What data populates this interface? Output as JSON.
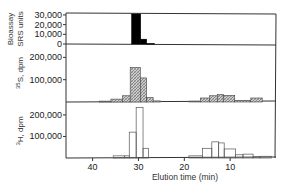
{
  "chart_data": [
    {
      "type": "bar",
      "panel": "top",
      "ylabel_lines": [
        "Bioassay",
        "SRS units"
      ],
      "ylim": [
        0,
        32000
      ],
      "yticks": [
        0,
        10000,
        20000,
        30000
      ],
      "ytick_labels": [
        "0",
        "10,000",
        "20,000",
        "30,000"
      ],
      "fill": "solid-black",
      "bars": [
        {
          "x0": 31.5,
          "x1": 29.5,
          "value": 31000
        },
        {
          "x0": 29.5,
          "x1": 28.2,
          "value": 5000
        },
        {
          "x0": 28.2,
          "x1": 26.5,
          "value": 500
        }
      ]
    },
    {
      "type": "bar",
      "panel": "middle",
      "ylabel_prefix": "35",
      "ylabel": "S, dpm",
      "ylim": [
        0,
        260000
      ],
      "yticks": [
        100000,
        200000
      ],
      "ytick_labels": [
        "100,000",
        "200,000"
      ],
      "fill": "hatched",
      "bars": [
        {
          "x0": 38.5,
          "x1": 36.0,
          "value": 4000
        },
        {
          "x0": 36.0,
          "x1": 33.5,
          "value": 13000
        },
        {
          "x0": 33.5,
          "x1": 31.8,
          "value": 28000
        },
        {
          "x0": 31.8,
          "x1": 29.6,
          "value": 155000
        },
        {
          "x0": 29.6,
          "x1": 28.2,
          "value": 108000
        },
        {
          "x0": 28.2,
          "x1": 26.8,
          "value": 20000
        },
        {
          "x0": 26.8,
          "x1": 25.2,
          "value": 5000
        },
        {
          "x0": 19.0,
          "x1": 16.5,
          "value": 4000
        },
        {
          "x0": 16.5,
          "x1": 14.5,
          "value": 18000
        },
        {
          "x0": 14.5,
          "x1": 12.8,
          "value": 28000
        },
        {
          "x0": 12.8,
          "x1": 11.5,
          "value": 33000
        },
        {
          "x0": 11.5,
          "x1": 9.0,
          "value": 30000
        },
        {
          "x0": 9.0,
          "x1": 5.5,
          "value": 6000
        },
        {
          "x0": 5.5,
          "x1": 3.0,
          "value": 18000
        }
      ]
    },
    {
      "type": "bar",
      "panel": "bottom",
      "ylabel_prefix": "3",
      "ylabel": "H, dpm",
      "ylim": [
        0,
        260000
      ],
      "yticks": [
        100000,
        200000
      ],
      "ytick_labels": [
        "100,000",
        "200,000"
      ],
      "fill": "open",
      "bars": [
        {
          "x0": 35.5,
          "x1": 33.0,
          "value": 10000
        },
        {
          "x0": 33.0,
          "x1": 32.0,
          "value": 10000
        },
        {
          "x0": 32.0,
          "x1": 30.5,
          "value": 120000
        },
        {
          "x0": 30.5,
          "x1": 29.0,
          "value": 235000
        },
        {
          "x0": 29.0,
          "x1": 27.8,
          "value": 45000
        },
        {
          "x0": 19.0,
          "x1": 16.0,
          "value": 10000
        },
        {
          "x0": 16.0,
          "x1": 14.0,
          "value": 45000
        },
        {
          "x0": 14.0,
          "x1": 12.5,
          "value": 75000
        },
        {
          "x0": 12.5,
          "x1": 11.3,
          "value": 70000
        },
        {
          "x0": 11.3,
          "x1": 8.8,
          "value": 42000
        },
        {
          "x0": 8.8,
          "x1": 7.2,
          "value": 15000
        },
        {
          "x0": 7.2,
          "x1": 5.0,
          "value": 18000
        },
        {
          "x0": 5.0,
          "x1": 3.5,
          "value": 6000
        },
        {
          "x0": 3.5,
          "x1": 1.0,
          "value": 8000
        }
      ]
    }
  ],
  "x_axis": {
    "label": "Elution time (min)",
    "xlim": [
      45.8,
      0
    ],
    "ticks": [
      40,
      30,
      20,
      10
    ],
    "tick_labels": [
      "40",
      "30",
      "20",
      "10"
    ],
    "direction": "decreasing-left-to-right"
  },
  "grid": false,
  "legend": "none"
}
